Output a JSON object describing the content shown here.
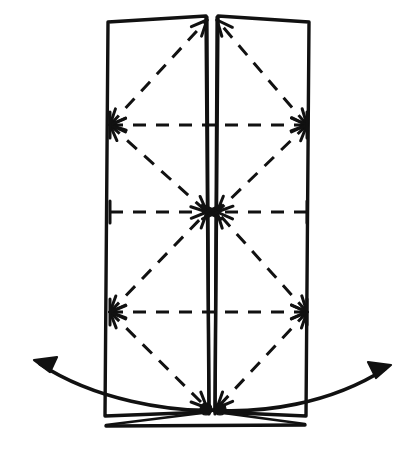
{
  "figure": {
    "style": "hand-drawn line art",
    "background_color": "#ffffff",
    "ink_color": "#111111"
  },
  "canvas": {
    "width": 412,
    "height": 471
  },
  "panels": [
    {
      "name": "left-panel",
      "outline": "M 108,22 L 206,16 L 209,412 L 105,416 Z",
      "top_edge": "M 108,22 L 206,16",
      "left_edge": "M 108,22 L 105,416",
      "bottom_edge": "M 105,416 L 209,412"
    },
    {
      "name": "right-panel",
      "outline": "M 218,16 L 309,22 L 306,416 L 215,412 Z",
      "top_edge": "M 218,16 L 309,22",
      "right_edge": "M 309,22 L 306,416",
      "bottom_edge": "M 215,412 L 306,416"
    }
  ],
  "spine": {
    "name": "center-fold",
    "left_line": "M 207,17 L 209,414",
    "right_line": "M 217,17 L 215,414",
    "gap_px": 9
  },
  "creases": {
    "horizontal": [
      {
        "name": "upper-crease",
        "y": 125,
        "x1": 110,
        "x2": 307,
        "arrow_direction": "outward"
      },
      {
        "name": "middle-crease",
        "y": 212,
        "x1": 110,
        "x2": 307,
        "arrow_direction": "inward"
      },
      {
        "name": "lower-crease",
        "y": 312,
        "x1": 110,
        "x2": 307,
        "arrow_direction": "outward"
      }
    ],
    "diagonals": [
      {
        "name": "left-upper-diagonal",
        "from": [
          110,
          125
        ],
        "to": [
          207,
          20
        ]
      },
      {
        "name": "left-mid-upper-diagonal",
        "from": [
          110,
          125
        ],
        "to": [
          207,
          212
        ]
      },
      {
        "name": "left-mid-lower-diagonal",
        "from": [
          110,
          312
        ],
        "to": [
          207,
          212
        ]
      },
      {
        "name": "left-lower-diagonal",
        "from": [
          110,
          312
        ],
        "to": [
          207,
          408
        ]
      },
      {
        "name": "right-upper-diagonal",
        "from": [
          307,
          125
        ],
        "to": [
          217,
          20
        ]
      },
      {
        "name": "right-mid-upper-diagonal",
        "from": [
          307,
          125
        ],
        "to": [
          217,
          212
        ]
      },
      {
        "name": "right-mid-lower-diagonal",
        "from": [
          307,
          312
        ],
        "to": [
          217,
          212
        ]
      },
      {
        "name": "right-lower-diagonal",
        "from": [
          307,
          312
        ],
        "to": [
          217,
          408
        ]
      }
    ]
  },
  "convergence_points": [
    {
      "name": "top-apex",
      "x": 212,
      "y": 18,
      "incoming_arrows": 2
    },
    {
      "name": "left-upper-node",
      "x": 110,
      "y": 125,
      "incoming_arrows": 3
    },
    {
      "name": "right-upper-node",
      "x": 307,
      "y": 125,
      "incoming_arrows": 3
    },
    {
      "name": "center-node",
      "x": 212,
      "y": 212,
      "incoming_arrows": 8
    },
    {
      "name": "left-lower-node",
      "x": 110,
      "y": 312,
      "incoming_arrows": 3
    },
    {
      "name": "right-lower-node",
      "x": 307,
      "y": 312,
      "incoming_arrows": 3
    },
    {
      "name": "bottom-apex",
      "x": 212,
      "y": 408,
      "incoming_arrows": 2
    }
  ],
  "pivot_dots": [
    {
      "name": "left-pivot-dot",
      "x": 206,
      "y": 409,
      "radius": 6
    },
    {
      "name": "right-pivot-dot",
      "x": 220,
      "y": 409,
      "radius": 6
    }
  ],
  "motion_arrows": [
    {
      "name": "left-motion-arrow",
      "direction": "left-outward",
      "path": "M 216,410 C 170,412 95,400 40,364",
      "tip": [
        34,
        360
      ],
      "label": ""
    },
    {
      "name": "right-motion-arrow",
      "direction": "right-outward",
      "path": "M 208,410 C 262,414 330,404 385,369",
      "tip": [
        391,
        365
      ],
      "label": ""
    }
  ],
  "bottom_tails": [
    {
      "name": "left-bottom-tail",
      "path": "M 210,412 L 106,425"
    },
    {
      "name": "right-bottom-tail",
      "path": "M 216,412 L 305,424"
    },
    {
      "name": "bottom-base-line",
      "path": "M 106,426 L 305,425"
    }
  ]
}
